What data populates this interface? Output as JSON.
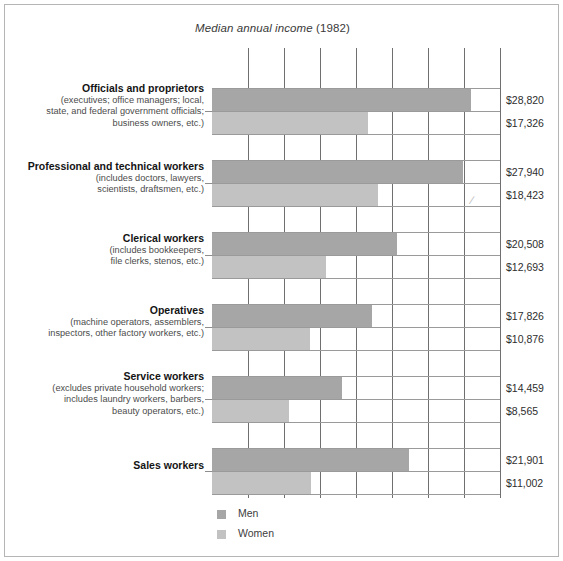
{
  "chart_title": {
    "main": "Median annual income",
    "year": "(1982)",
    "full": "Median annual income (1982)"
  },
  "legend": {
    "position": "bottom-left",
    "items": [
      {
        "label": "Men",
        "color": "#a6a6a6",
        "key": "men"
      },
      {
        "label": "Women",
        "color": "#c2c2c2",
        "key": "women"
      }
    ]
  },
  "categories": [
    {
      "title": "Officials and proprietors",
      "sub_lines": [
        "(executives; office managers; local,",
        "state, and federal government officials;",
        "business owners, etc.)"
      ],
      "men_value": 28820,
      "women_value": 17326,
      "men_label": "$28,820",
      "women_label": "$17,326"
    },
    {
      "title": "Professional and technical workers",
      "sub_lines": [
        "(includes doctors, lawyers,",
        "scientists, draftsmen, etc.)"
      ],
      "men_value": 27940,
      "women_value": 18423,
      "men_label": "$27,940",
      "women_label": "$18,423"
    },
    {
      "title": "Clerical workers",
      "sub_lines": [
        "(includes bookkeepers,",
        "file clerks, stenos, etc.)"
      ],
      "men_value": 20508,
      "women_value": 12693,
      "men_label": "$20,508",
      "women_label": "$12,693"
    },
    {
      "title": "Operatives",
      "sub_lines": [
        "(machine operators, assemblers,",
        "inspectors, other factory workers, etc.)"
      ],
      "men_value": 17826,
      "women_value": 10876,
      "men_label": "$17,826",
      "women_label": "$10,876"
    },
    {
      "title": "Service workers",
      "sub_lines": [
        "(excludes private household workers;",
        "includes laundry workers, barbers,",
        "beauty operators, etc.)"
      ],
      "men_value": 14459,
      "women_value": 8565,
      "men_label": "$14,459",
      "women_label": "$8,565"
    },
    {
      "title": "Sales workers",
      "sub_lines": [],
      "men_value": 21901,
      "women_value": 11002,
      "men_label": "$21,901",
      "women_label": "$11,002"
    }
  ],
  "chart_data": {
    "type": "bar",
    "orientation": "horizontal",
    "title": "Median annual income (1982)",
    "xlabel": "",
    "ylabel": "",
    "xlim": [
      0,
      32000
    ],
    "grid": "vertical-only",
    "gridline_step": 4000,
    "legend_position": "bottom-left",
    "categories": [
      "Officials and proprietors",
      "Professional and technical workers",
      "Clerical workers",
      "Operatives",
      "Service workers",
      "Sales workers"
    ],
    "series": [
      {
        "name": "Men",
        "color": "#a6a6a6",
        "values": [
          28820,
          27940,
          20508,
          17826,
          14459,
          21901
        ],
        "labels": [
          "$28,820",
          "$27,940",
          "$20,508",
          "$17,826",
          "$14,459",
          "$21,901"
        ]
      },
      {
        "name": "Women",
        "color": "#c2c2c2",
        "values": [
          17326,
          18423,
          12693,
          10876,
          8565,
          11002
        ],
        "labels": [
          "$17,326",
          "$18,423",
          "$12,693",
          "$10,876",
          "$8,565",
          "$11,002"
        ]
      }
    ]
  }
}
